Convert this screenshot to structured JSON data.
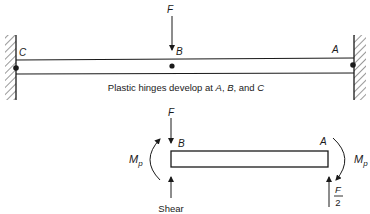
{
  "figure": {
    "top_diagram": {
      "load_label": "F",
      "points": {
        "c": "C",
        "b": "B",
        "a": "A"
      },
      "caption_prefix": "Plastic hinges develop at ",
      "caption_a": "A",
      "caption_sep1": ", ",
      "caption_b": "B",
      "caption_sep2": ", and ",
      "caption_c": "C"
    },
    "bottom_diagram": {
      "load_label": "F",
      "points": {
        "b": "B",
        "a": "A"
      },
      "moment_left": {
        "main": "M",
        "sub": "p"
      },
      "moment_right": {
        "main": "M",
        "sub": "p"
      },
      "shear_label": "Shear",
      "reaction_numerator": "F",
      "reaction_denominator": "2"
    },
    "colors": {
      "ink": "#1a1a1a",
      "background": "#ffffff"
    }
  }
}
